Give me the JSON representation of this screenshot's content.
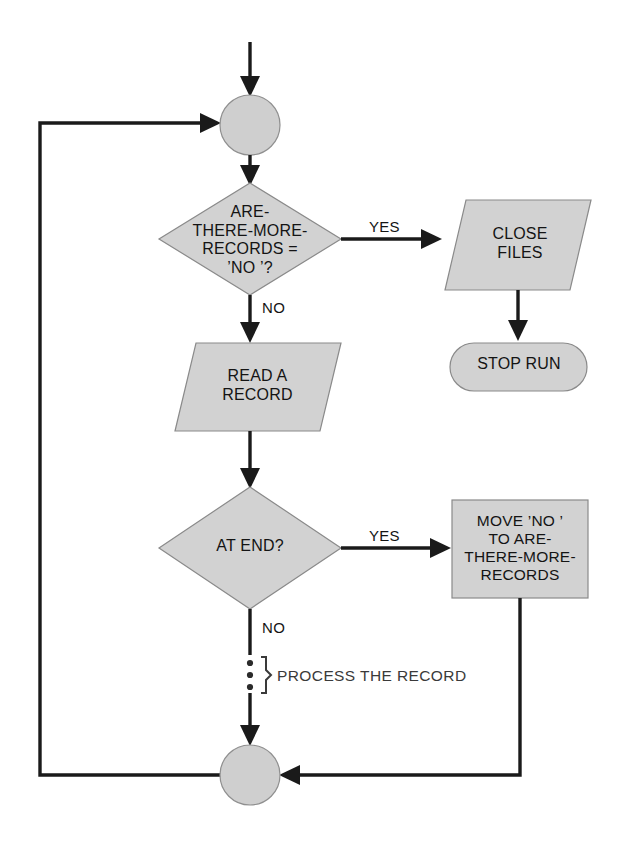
{
  "diagram": {
    "colors": {
      "shape_fill": "#d2d2d2",
      "shape_stroke": "#8a8a8a",
      "line": "#1a1a1a",
      "background": "#ffffff",
      "text": "#141414"
    },
    "nodes": {
      "start_connector": {
        "shape": "circle",
        "label": ""
      },
      "decision_more_records": {
        "shape": "diamond",
        "line1": "ARE-",
        "line2": "THERE-MORE-",
        "line3": "RECORDS =",
        "line4": "’NO ’?"
      },
      "close_files": {
        "shape": "parallelogram",
        "line1": "CLOSE",
        "line2": "FILES"
      },
      "stop_run": {
        "shape": "terminal",
        "line1": "STOP RUN"
      },
      "read_a_record": {
        "shape": "parallelogram",
        "line1": "READ A",
        "line2": "RECORD"
      },
      "decision_at_end": {
        "shape": "diamond",
        "line1": "AT END?"
      },
      "move_no": {
        "shape": "rectangle",
        "line1": "MOVE ’NO ’",
        "line2": "TO ARE-",
        "line3": "THERE-MORE-",
        "line4": "RECORDS"
      },
      "end_connector": {
        "shape": "circle",
        "label": ""
      }
    },
    "edge_labels": {
      "yes_more_records": "YES",
      "no_more_records": "NO",
      "yes_at_end": "YES",
      "no_at_end": "NO"
    },
    "annotations": {
      "process_the_record": "PROCESS THE RECORD"
    }
  }
}
